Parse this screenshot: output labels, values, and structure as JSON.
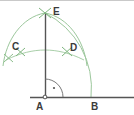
{
  "figure": {
    "colors": {
      "line": "#4a4a4a",
      "arc": "#8dbf8d",
      "arc_light": "#b9d6b9",
      "label": "#3b3b3b",
      "background": "#ffffff",
      "top_border": "#c9c9c9"
    },
    "labels": [
      {
        "id": "label-E",
        "text": "E",
        "x": 53,
        "y": 7
      },
      {
        "id": "label-C",
        "text": "C",
        "x": 12,
        "y": 42
      },
      {
        "id": "label-D",
        "text": "D",
        "x": 70,
        "y": 43
      },
      {
        "id": "label-A",
        "text": "A",
        "x": 36,
        "y": 102
      },
      {
        "id": "label-B",
        "text": "B",
        "x": 91,
        "y": 102
      }
    ],
    "points": {
      "A": {
        "x": 45,
        "y": 97
      },
      "B": {
        "x": 91,
        "y": 97
      },
      "C": {
        "x": 20,
        "y": 51
      },
      "D": {
        "x": 67,
        "y": 51
      },
      "E": {
        "x": 45,
        "y": 13
      }
    },
    "segments": [
      {
        "id": "baseline-AB",
        "x1": 30,
        "y1": 97,
        "x2": 134,
        "y2": 97
      },
      {
        "id": "perpendicular-AE",
        "x1": 45,
        "y1": 13,
        "x2": 45,
        "y2": 99
      }
    ],
    "arcs": [
      {
        "id": "arc-CD-through-E",
        "note": "large arc from lower-left through C, E, D"
      },
      {
        "id": "arc-quarter-EB",
        "note": "quarter circle centred at A from E to B"
      },
      {
        "id": "arc-right-angle-marker",
        "note": "small quarter arc at A with dot"
      }
    ],
    "marks": [
      {
        "id": "intersection-E",
        "x": 45,
        "y": 13
      },
      {
        "id": "intersection-D",
        "x": 67,
        "y": 51
      },
      {
        "id": "intersection-C",
        "x": 20,
        "y": 51
      },
      {
        "id": "vertex-dot-A",
        "x": 45,
        "y": 97
      },
      {
        "id": "right-angle-dot",
        "x": 54,
        "y": 87
      }
    ]
  }
}
